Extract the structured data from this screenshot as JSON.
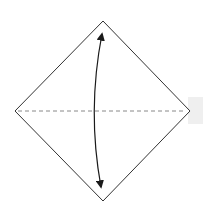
{
  "diagram": {
    "type": "origami-fold-step",
    "shape": "square-diamond",
    "fold_line": "horizontal-valley-fold-dashed",
    "arrow": "double-headed-curved-vertical",
    "colors": {
      "outline": "#333333",
      "fold_line": "#888888",
      "arrow": "#1a1a1a",
      "band": "#efefef",
      "paper": "#ffffff"
    }
  }
}
